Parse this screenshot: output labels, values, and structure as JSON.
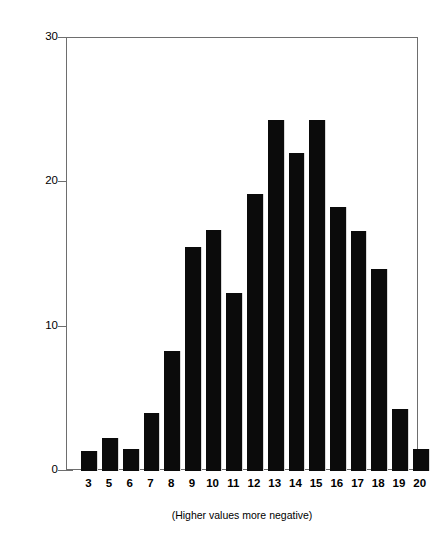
{
  "chart_data": {
    "type": "bar",
    "title": "",
    "subtitle": "",
    "xlabel": "(Higher values more negative)",
    "ylabel": "Number of Cases",
    "categories": [
      "3",
      "5",
      "6",
      "7",
      "8",
      "9",
      "10",
      "11",
      "12",
      "13",
      "14",
      "15",
      "16",
      "17",
      "18",
      "19",
      "20"
    ],
    "values": [
      1.4,
      2.3,
      1.5,
      4.0,
      8.3,
      15.5,
      16.7,
      12.3,
      19.2,
      24.3,
      22.0,
      24.3,
      18.3,
      16.6,
      14.0,
      4.3,
      1.5
    ],
    "series": [
      {
        "name": "Number of Cases",
        "values": [
          1.4,
          2.3,
          1.5,
          4.0,
          8.3,
          15.5,
          16.7,
          12.3,
          19.2,
          24.3,
          22.0,
          24.3,
          18.3,
          16.6,
          14.0,
          4.3,
          1.5
        ]
      }
    ],
    "ylim": [
      0,
      30
    ],
    "yticks": [
      0,
      10,
      20,
      30
    ],
    "ytick_labels": [
      "0",
      "10",
      "20",
      "30"
    ],
    "grid": false,
    "legend": "none",
    "bar_color": "#0b0b0b",
    "axis_color": "#6e6e6e",
    "background_color": "#ffffff"
  },
  "axes": {
    "y": {
      "title": "Number of Cases",
      "ticks": [
        {
          "label": "30",
          "value": 30
        },
        {
          "label": "20",
          "value": 20
        },
        {
          "label": "10",
          "value": 10
        },
        {
          "label": "0",
          "value": 0
        }
      ]
    },
    "x": {
      "caption": "(Higher values more negative)",
      "ticks": [
        "3",
        "5",
        "6",
        "7",
        "8",
        "9",
        "10",
        "11",
        "12",
        "13",
        "14",
        "15",
        "16",
        "17",
        "18",
        "19",
        "20"
      ]
    }
  }
}
